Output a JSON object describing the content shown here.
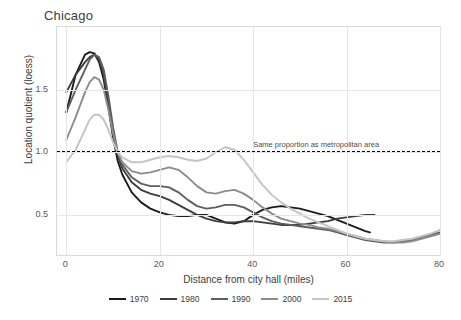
{
  "chart_data": {
    "type": "line",
    "title": "Chicago",
    "xlabel": "Distance from city hall (miles)",
    "ylabel": "Location quotient (loess)",
    "xlim": [
      -2,
      80
    ],
    "ylim": [
      0.18,
      2.0
    ],
    "xticks": [
      "0",
      "20",
      "40",
      "60",
      "80"
    ],
    "xtick_values": [
      0,
      20,
      40,
      60,
      80
    ],
    "yticks": [
      "0.5",
      "1.0",
      "1.5"
    ],
    "ytick_values": [
      0.5,
      1.0,
      1.5
    ],
    "grid": true,
    "legend_position": "bottom",
    "reference_line": {
      "value": 1.0,
      "label": "Same proportion as metropolitan area",
      "style": "dashed",
      "color": "#000000"
    },
    "series": [
      {
        "name": "1970",
        "color": "#1c1c1c",
        "x": [
          0,
          2,
          4,
          5,
          6,
          7,
          8,
          9,
          10,
          11,
          12,
          14,
          16,
          18,
          20,
          22,
          24,
          26,
          28,
          30,
          32,
          34,
          36,
          38,
          40,
          42,
          44,
          46,
          48,
          50,
          52,
          54,
          56,
          58,
          60,
          62,
          64,
          65
        ],
        "y": [
          1.32,
          1.62,
          1.78,
          1.8,
          1.79,
          1.72,
          1.58,
          1.36,
          1.12,
          0.93,
          0.82,
          0.68,
          0.6,
          0.55,
          0.52,
          0.5,
          0.49,
          0.49,
          0.5,
          0.5,
          0.47,
          0.44,
          0.43,
          0.45,
          0.5,
          0.54,
          0.56,
          0.57,
          0.56,
          0.55,
          0.53,
          0.51,
          0.49,
          0.46,
          0.43,
          0.4,
          0.37,
          0.36
        ]
      },
      {
        "name": "1980",
        "color": "#3d3d3d",
        "x": [
          0,
          2,
          4,
          5,
          6,
          7,
          8,
          9,
          10,
          11,
          12,
          14,
          16,
          18,
          20,
          22,
          24,
          26,
          28,
          30,
          32,
          34,
          36,
          38,
          40,
          42,
          44,
          46,
          48,
          50,
          52,
          54,
          56,
          58,
          60,
          62,
          64,
          66
        ],
        "y": [
          1.48,
          1.62,
          1.72,
          1.76,
          1.78,
          1.74,
          1.62,
          1.4,
          1.15,
          0.97,
          0.87,
          0.76,
          0.7,
          0.67,
          0.65,
          0.62,
          0.58,
          0.54,
          0.5,
          0.47,
          0.45,
          0.44,
          0.44,
          0.45,
          0.45,
          0.44,
          0.43,
          0.42,
          0.42,
          0.42,
          0.43,
          0.44,
          0.45,
          0.47,
          0.48,
          0.49,
          0.5,
          0.5
        ]
      },
      {
        "name": "1990",
        "color": "#5e5e5e",
        "x": [
          0,
          2,
          4,
          5,
          6,
          7,
          8,
          9,
          10,
          11,
          12,
          14,
          16,
          18,
          20,
          22,
          24,
          26,
          28,
          30,
          32,
          34,
          36,
          38,
          40,
          42,
          44,
          46,
          48,
          50,
          52,
          54,
          56,
          58,
          60,
          62,
          64,
          66,
          68,
          70,
          72,
          74,
          76,
          78,
          80
        ],
        "y": [
          1.32,
          1.5,
          1.66,
          1.74,
          1.78,
          1.76,
          1.66,
          1.45,
          1.2,
          1.0,
          0.9,
          0.8,
          0.75,
          0.73,
          0.73,
          0.72,
          0.68,
          0.62,
          0.57,
          0.55,
          0.56,
          0.58,
          0.58,
          0.56,
          0.52,
          0.48,
          0.45,
          0.43,
          0.42,
          0.41,
          0.4,
          0.39,
          0.38,
          0.36,
          0.34,
          0.32,
          0.3,
          0.29,
          0.28,
          0.28,
          0.29,
          0.3,
          0.32,
          0.34,
          0.36
        ]
      },
      {
        "name": "2000",
        "color": "#8c8c8c",
        "x": [
          0,
          2,
          4,
          5,
          6,
          7,
          8,
          9,
          10,
          11,
          12,
          14,
          16,
          18,
          20,
          22,
          24,
          26,
          28,
          30,
          32,
          34,
          36,
          38,
          40,
          42,
          44,
          46,
          48,
          50,
          52,
          54,
          56,
          58,
          60,
          62,
          64,
          66,
          68,
          70,
          72,
          74,
          76,
          78,
          80
        ],
        "y": [
          1.1,
          1.28,
          1.48,
          1.56,
          1.6,
          1.58,
          1.5,
          1.34,
          1.15,
          1.0,
          0.92,
          0.85,
          0.83,
          0.84,
          0.86,
          0.88,
          0.86,
          0.8,
          0.73,
          0.68,
          0.67,
          0.69,
          0.7,
          0.67,
          0.62,
          0.56,
          0.51,
          0.47,
          0.45,
          0.43,
          0.42,
          0.4,
          0.39,
          0.37,
          0.35,
          0.33,
          0.31,
          0.3,
          0.29,
          0.28,
          0.28,
          0.29,
          0.31,
          0.33,
          0.35
        ]
      },
      {
        "name": "2015",
        "color": "#c4c4c4",
        "x": [
          0,
          2,
          4,
          5,
          6,
          7,
          8,
          9,
          10,
          11,
          12,
          14,
          16,
          18,
          20,
          22,
          24,
          26,
          28,
          30,
          32,
          34,
          36,
          38,
          40,
          42,
          44,
          46,
          48,
          50,
          52,
          54,
          56,
          58,
          60,
          62,
          64,
          66,
          68,
          70,
          72,
          74,
          76,
          78,
          80
        ],
        "y": [
          0.92,
          1.02,
          1.18,
          1.26,
          1.3,
          1.3,
          1.26,
          1.18,
          1.08,
          1.0,
          0.96,
          0.92,
          0.92,
          0.94,
          0.96,
          0.97,
          0.96,
          0.94,
          0.93,
          0.95,
          1.0,
          1.04,
          1.02,
          0.94,
          0.84,
          0.74,
          0.66,
          0.6,
          0.55,
          0.51,
          0.47,
          0.44,
          0.41,
          0.38,
          0.35,
          0.33,
          0.31,
          0.3,
          0.29,
          0.29,
          0.3,
          0.31,
          0.33,
          0.35,
          0.38
        ]
      }
    ]
  }
}
